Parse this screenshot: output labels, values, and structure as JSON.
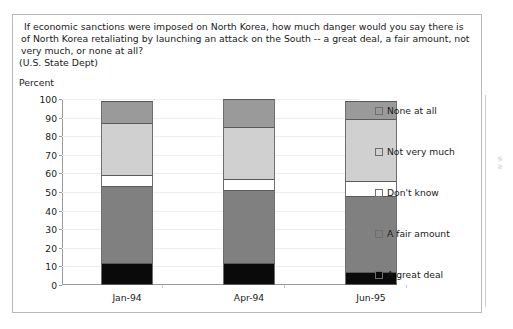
{
  "question": {
    "text": " If economic sanctions were imposed on North Korea, how much danger would you say there is of North Korea retaliating by launching an attack on the South -- a great deal, a fair amount, not very much, or none at all?",
    "source": "(U.S. State Dept)"
  },
  "axis": {
    "y_title": "Percent"
  },
  "chart_data": {
    "type": "bar",
    "subtype": "stacked-column-100",
    "title": "If economic sanctions were imposed on North Korea, how much danger would you say there is of North Korea retaliating by launching an attack on the South -- a great deal, a fair amount, not very much, or none at all?",
    "subtitle": "(U.S. State Dept)",
    "xlabel": "",
    "ylabel": "Percent",
    "ylim": [
      0,
      100
    ],
    "yticks": [
      0,
      10,
      20,
      30,
      40,
      50,
      60,
      70,
      80,
      90,
      100
    ],
    "grid": true,
    "legend_position": "right",
    "legend_order": [
      "None at all",
      "Not very much",
      "Don't know",
      "A fair amount",
      "A great deal"
    ],
    "categories": [
      "Jan-94",
      "Apr-94",
      "Jun-95"
    ],
    "series": [
      {
        "name": "A great deal",
        "color": "#0a0a0a",
        "values": [
          12,
          12,
          7
        ]
      },
      {
        "name": "A fair amount",
        "color": "#808080",
        "values": [
          41,
          39,
          41
        ]
      },
      {
        "name": "Don't know",
        "color": "#ffffff",
        "values": [
          6,
          6,
          8
        ]
      },
      {
        "name": "Not very much",
        "color": "#d0d0d0",
        "values": [
          28,
          28,
          33
        ]
      },
      {
        "name": "None at all",
        "color": "#9a9a9a",
        "values": [
          12,
          15,
          10
        ]
      }
    ],
    "totals": [
      99,
      100,
      99
    ]
  }
}
